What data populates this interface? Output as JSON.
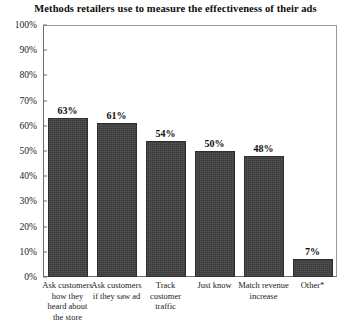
{
  "chart_data": {
    "type": "bar",
    "title": "Methods retailers use to measure the effectiveness of their ads",
    "xlabel": "",
    "ylabel": "",
    "ylim": [
      0,
      100
    ],
    "grid": false,
    "legend": "none",
    "categories": [
      "Ask customers how they heard about the store",
      "Ask customers if they saw ad",
      "Track customer traffic",
      "Just know",
      "Match revenue increase",
      "Other*"
    ],
    "values": [
      63,
      61,
      54,
      50,
      48,
      7
    ],
    "value_labels": [
      "63%",
      "61%",
      "54%",
      "50%",
      "48%",
      "7%"
    ],
    "yticks": [
      0,
      10,
      20,
      30,
      40,
      50,
      60,
      70,
      80,
      90,
      100
    ],
    "ytick_labels": [
      "0%",
      "10%",
      "20%",
      "30%",
      "40%",
      "50%",
      "60%",
      "70%",
      "80%",
      "90%",
      "100%"
    ],
    "bar_color": "#3f3f3f",
    "frame_color": "#6e6e6e",
    "background": "#ffffff"
  }
}
